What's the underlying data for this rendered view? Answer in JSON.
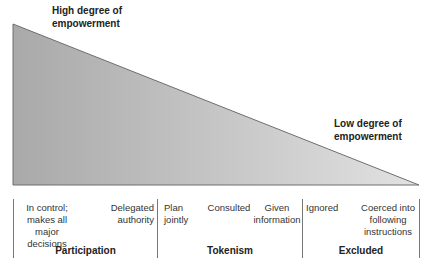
{
  "diagram": {
    "title_high": "High degree of empowerment",
    "high_line1": "High degree of",
    "high_line2": "empowerment",
    "low_line1": "Low degree of",
    "low_line2": "empowerment",
    "colors": {
      "fill_dark": "#a9a9a9",
      "fill_light": "#e2e2e2",
      "outline": "#6e6e6e",
      "divider": "#777777"
    },
    "groups": [
      {
        "label": "Participation",
        "items": [
          {
            "lines": [
              "In control;",
              "makes all",
              "major decisions"
            ]
          },
          {
            "lines": [
              "Delegated",
              "authority"
            ]
          }
        ]
      },
      {
        "label": "Tokenism",
        "items": [
          {
            "lines": [
              "Plan",
              "jointly"
            ]
          },
          {
            "lines": [
              "Consulted"
            ]
          },
          {
            "lines": [
              "Given",
              "information"
            ]
          }
        ]
      },
      {
        "label": "Excluded",
        "items": [
          {
            "lines": [
              "Ignored"
            ]
          },
          {
            "lines": [
              "Coerced into",
              "following",
              "instructions"
            ]
          }
        ]
      }
    ]
  }
}
